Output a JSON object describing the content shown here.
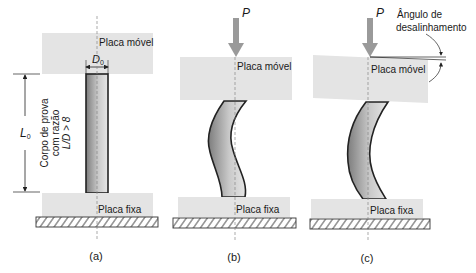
{
  "figure": {
    "panels": [
      {
        "id": "a",
        "caption": "(a)",
        "top_plate_label": "Placa móvel",
        "bottom_plate_label": "Placa fixa",
        "diameter_label": "D",
        "diameter_subscript": "0",
        "length_label": "L",
        "length_subscript": "0",
        "specimen_label_line1": "Corpo de prova",
        "specimen_label_line2": "com razão",
        "specimen_label_line3": "L/D > 8"
      },
      {
        "id": "b",
        "caption": "(b)",
        "load_label": "P",
        "top_plate_label": "Placa móvel",
        "bottom_plate_label": "Placa fixa"
      },
      {
        "id": "c",
        "caption": "(c)",
        "load_label": "P",
        "top_plate_label": "Placa móvel",
        "bottom_plate_label": "Placa fixa",
        "misalignment_label_line1": "Ângulo de",
        "misalignment_label_line2": "desalinhamento"
      }
    ],
    "colors": {
      "plate": "#e4e4e4",
      "specimen_dark": "#8a8a8a",
      "specimen_light": "#d6d6d6",
      "arrow": "#9a9a9a",
      "outline": "#222222",
      "centerline": "#888888"
    }
  }
}
